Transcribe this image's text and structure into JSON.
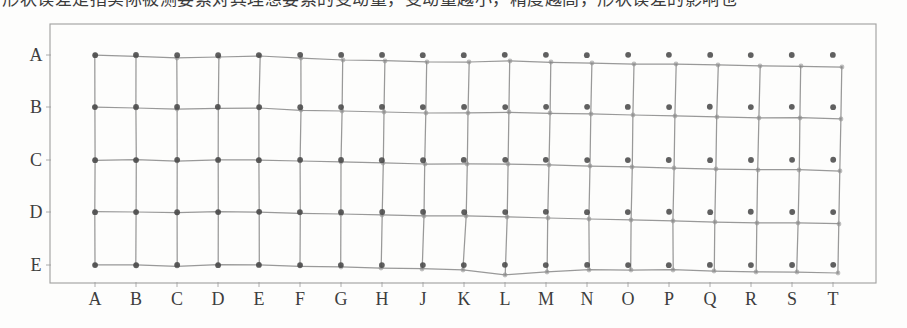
{
  "caption": {
    "text": "形状误差是指实际被测要素对其理想要素的变动量，变动量越小，精度越高，形状误差的影响也",
    "note": "clipped-bottom-of-text-line"
  },
  "figure": {
    "name": "grid-distortion-map",
    "frame": {
      "x": 50,
      "y": 24,
      "width": 826,
      "height": 259,
      "stroke": "#8e8e8e"
    },
    "colors": {
      "mesh_line": "#7c7c7c",
      "node_marker": "#8a8a8a",
      "reference_dot": "#4a4a4a",
      "frame": "#8e8e8e",
      "tick": "#9a9a9a",
      "label_text": "#2e2e2e",
      "page_background": "#fdfdfc"
    },
    "y_axis": {
      "name": "row-labels",
      "labels": [
        "A",
        "B",
        "C",
        "D",
        "E"
      ],
      "positions": [
        55,
        107,
        160,
        212,
        265
      ]
    },
    "x_axis": {
      "name": "column-labels",
      "labels": [
        "A",
        "B",
        "C",
        "D",
        "E",
        "F",
        "G",
        "H",
        "J",
        "K",
        "L",
        "M",
        "N",
        "O",
        "P",
        "Q",
        "R",
        "S",
        "T"
      ],
      "note": "letter I is skipped"
    }
  },
  "chart_data": {
    "type": "scatter",
    "title": "",
    "subtitle": "",
    "xlabel": "",
    "ylabel": "",
    "grid": true,
    "legend": null,
    "columns": [
      "A",
      "B",
      "C",
      "D",
      "E",
      "F",
      "G",
      "H",
      "J",
      "K",
      "L",
      "M",
      "N",
      "O",
      "P",
      "Q",
      "R",
      "S",
      "T",
      "T2"
    ],
    "rows": [
      "A",
      "B",
      "C",
      "D",
      "E"
    ],
    "nominal_x": [
      95,
      136,
      177,
      218,
      259,
      300,
      341,
      382,
      423,
      464,
      505,
      546,
      587,
      628,
      669,
      710,
      751,
      792,
      833,
      862
    ],
    "nominal_y": [
      55,
      107,
      160,
      212,
      265
    ],
    "series": [
      {
        "name": "row-A-measured",
        "x": [
          95,
          136,
          177,
          219,
          260,
          301,
          343,
          385,
          427,
          469,
          510,
          551,
          592,
          634,
          676,
          718,
          760,
          801,
          842,
          870
        ],
        "y": [
          55,
          56,
          58,
          57,
          56,
          58,
          60,
          61,
          62,
          62,
          61,
          62,
          63,
          64,
          64,
          65,
          66,
          66,
          67,
          68
        ]
      },
      {
        "name": "row-B-measured",
        "x": [
          95,
          136,
          177,
          218,
          259,
          301,
          342,
          384,
          426,
          468,
          509,
          550,
          591,
          633,
          675,
          717,
          759,
          800,
          841,
          869
        ],
        "y": [
          107,
          108,
          109,
          108,
          108,
          110,
          111,
          112,
          113,
          113,
          112,
          113,
          114,
          115,
          116,
          117,
          118,
          118,
          119,
          120
        ]
      },
      {
        "name": "row-C-measured",
        "x": [
          95,
          136,
          177,
          218,
          259,
          300,
          341,
          383,
          425,
          467,
          508,
          549,
          590,
          632,
          674,
          716,
          758,
          799,
          840,
          868
        ],
        "y": [
          160,
          160,
          161,
          160,
          160,
          161,
          162,
          163,
          164,
          164,
          164,
          165,
          166,
          167,
          168,
          169,
          170,
          170,
          171,
          172
        ]
      },
      {
        "name": "row-D-measured",
        "x": [
          95,
          136,
          177,
          218,
          259,
          300,
          341,
          382,
          424,
          466,
          507,
          548,
          589,
          631,
          673,
          715,
          757,
          798,
          839,
          867
        ],
        "y": [
          212,
          212,
          213,
          212,
          212,
          213,
          214,
          215,
          216,
          216,
          217,
          218,
          219,
          220,
          221,
          222,
          223,
          223,
          224,
          225
        ]
      },
      {
        "name": "row-E-measured",
        "x": [
          95,
          136,
          177,
          218,
          259,
          300,
          341,
          381,
          422,
          463,
          505,
          547,
          589,
          631,
          673,
          714,
          756,
          797,
          838,
          866
        ],
        "y": [
          265,
          265,
          266,
          265,
          265,
          266,
          267,
          268,
          269,
          270,
          275,
          272,
          270,
          270,
          270,
          271,
          272,
          272,
          273,
          274
        ]
      }
    ]
  }
}
